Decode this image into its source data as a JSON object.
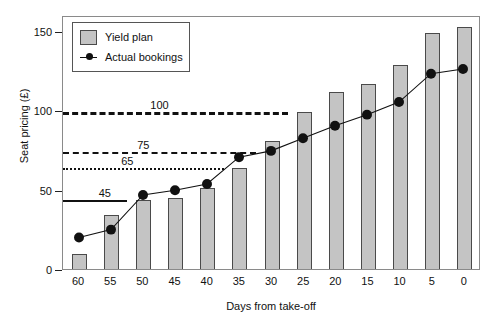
{
  "chart_data": {
    "type": "bar",
    "title": "",
    "xlabel": "Days from take-off",
    "ylabel": "Seat pricing (£)",
    "categories": [
      "60",
      "55",
      "50",
      "45",
      "40",
      "35",
      "30",
      "25",
      "20",
      "15",
      "10",
      "5",
      "0"
    ],
    "ylim": [
      0,
      160
    ],
    "yticks": [
      0,
      50,
      100,
      150
    ],
    "ytick_labels": [
      "0",
      "50",
      "100",
      "150"
    ],
    "grid": false,
    "legend_position": "top-left",
    "series": [
      {
        "name": "Yield plan",
        "type": "bar",
        "color": "#c4c4c4",
        "values": [
          11,
          35,
          45,
          46,
          52,
          65,
          82,
          100,
          113,
          118,
          130,
          150,
          154
        ]
      },
      {
        "name": "Actual bookings",
        "type": "line",
        "color": "#111111",
        "values": [
          20,
          25,
          47,
          50,
          54,
          71,
          75,
          83,
          91,
          98,
          106,
          124,
          127
        ]
      }
    ],
    "reference_lines": [
      {
        "label": "100",
        "value": 100,
        "style": "dash-long",
        "x_start": "60",
        "x_end": "25",
        "label_at": "47.5"
      },
      {
        "label": "75",
        "value": 75,
        "style": "dash-med",
        "x_start": "60",
        "x_end": "30",
        "label_at": "50"
      },
      {
        "label": "65",
        "value": 65,
        "style": "dot",
        "x_start": "60",
        "x_end": "35",
        "label_at": "52.5"
      },
      {
        "label": "45",
        "value": 45,
        "style": "solid",
        "x_start": "60",
        "x_end": "50",
        "label_at": "56"
      }
    ]
  },
  "legend": {
    "items": [
      {
        "label": "Yield plan",
        "marker": "bar-swatch-icon"
      },
      {
        "label": "Actual bookings",
        "marker": "line-marker-icon"
      }
    ]
  }
}
